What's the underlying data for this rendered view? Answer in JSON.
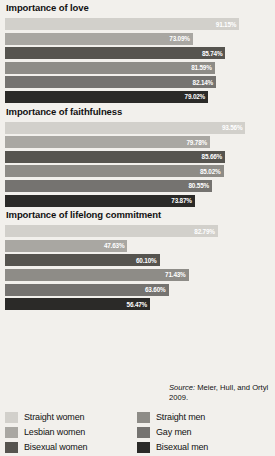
{
  "source": {
    "prefix": "Source:",
    "text": " Meier, Hull, and Ortyl 2009."
  },
  "legend": {
    "left": [
      {
        "label": "Straight women",
        "color": "#d2d0cb"
      },
      {
        "label": "Lesbian women",
        "color": "#a9a7a2"
      },
      {
        "label": "Bisexual women",
        "color": "#56544f"
      }
    ],
    "right": [
      {
        "label": "Straight men",
        "color": "#8e8c87"
      },
      {
        "label": "Gay men",
        "color": "#757370"
      },
      {
        "label": "Bisexual men",
        "color": "#2b2a28"
      }
    ]
  },
  "series_colors": [
    "#d2d0cb",
    "#a9a7a2",
    "#56544f",
    "#8e8c87",
    "#757370",
    "#2b2a28"
  ],
  "series_names": [
    "Straight women",
    "Lesbian women",
    "Bisexual women",
    "Straight men",
    "Gay men",
    "Bisexual men"
  ],
  "chart_data": [
    {
      "type": "bar",
      "title": "Importance of love",
      "orientation": "horizontal",
      "categories": [
        "Straight women",
        "Lesbian women",
        "Bisexual women",
        "Straight men",
        "Gay men",
        "Bisexual men"
      ],
      "values": [
        91.15,
        73.09,
        85.74,
        81.59,
        82.14,
        79.02
      ],
      "labels": [
        "91.15%",
        "73.09%",
        "85.74%",
        "81.59%",
        "82.14%",
        "79.02%"
      ],
      "xlabel": "",
      "ylabel": "",
      "xlim": [
        0,
        100
      ],
      "grid": false,
      "legend_position": "bottom"
    },
    {
      "type": "bar",
      "title": "Importance of faithfulness",
      "orientation": "horizontal",
      "categories": [
        "Straight women",
        "Lesbian women",
        "Bisexual women",
        "Straight men",
        "Gay men",
        "Bisexual men"
      ],
      "values": [
        93.56,
        79.78,
        85.66,
        85.02,
        80.55,
        73.87
      ],
      "labels": [
        "93.56%",
        "79.78%",
        "85.66%",
        "85.02%",
        "80.55%",
        "73.87%"
      ],
      "xlabel": "",
      "ylabel": "",
      "xlim": [
        0,
        100
      ],
      "grid": false,
      "legend_position": "bottom"
    },
    {
      "type": "bar",
      "title": "Importance of lifelong commitment",
      "orientation": "horizontal",
      "categories": [
        "Straight women",
        "Lesbian women",
        "Bisexual women",
        "Straight men",
        "Gay men",
        "Bisexual men"
      ],
      "values": [
        82.79,
        47.63,
        60.1,
        71.43,
        63.6,
        56.47
      ],
      "labels": [
        "82.79%",
        "47.63%",
        "60.10%",
        "71.43%",
        "63.60%",
        "56.47%"
      ],
      "xlabel": "",
      "ylabel": "",
      "xlim": [
        0,
        100
      ],
      "grid": false,
      "legend_position": "bottom"
    }
  ]
}
